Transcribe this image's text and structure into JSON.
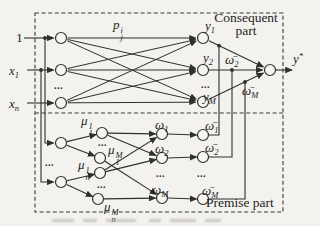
{
  "colors": {
    "ink": "#2f2f2f",
    "paper": "#f3f2ee"
  },
  "diagram": {
    "section_titles": {
      "consequent_line1": "Consequent",
      "consequent_line2": "part",
      "premise": "Premise part"
    },
    "ellipsis": "...",
    "inputs": {
      "one": "1",
      "x1": {
        "base": "x",
        "sub": "1"
      },
      "xn": {
        "base": "x",
        "sub": "n"
      }
    },
    "parameter": {
      "base": "p",
      "sup": "i",
      "sub": "j"
    },
    "consequent_nodes": {
      "y1": {
        "base": "y",
        "sub": "1"
      },
      "y2": {
        "base": "y",
        "sub": "2"
      },
      "yM": {
        "base": "y",
        "sub": "M"
      }
    },
    "output": {
      "base": "y",
      "sup": "*"
    },
    "firing_strengths": {
      "w1": {
        "base": "ω",
        "sub": "1"
      },
      "w2": {
        "base": "ω",
        "sub": "2"
      },
      "wM": {
        "base": "ω",
        "sub": "M"
      }
    },
    "normalized_strengths": {
      "nw1": {
        "base": "ω̄",
        "sub": "1"
      },
      "nw2": {
        "base": "ω̄",
        "sub": "2"
      },
      "nwM": {
        "base": "ω̄",
        "sub": "M"
      }
    },
    "consequent_weight_labels": {
      "w2": {
        "base": "ω̄",
        "sub": "2"
      },
      "wM": {
        "base": "ω̄",
        "sub": "M"
      }
    },
    "memberships": {
      "mu11": {
        "base": "μ",
        "sup": "1",
        "sub": "1"
      },
      "mu1M": {
        "base": "μ",
        "sup": "M",
        "sub": "1"
      },
      "mun1": {
        "base": "μ",
        "sup": "1",
        "sub": "n"
      },
      "munM": {
        "base": "μ",
        "sup": "M",
        "sub": "n"
      }
    }
  }
}
